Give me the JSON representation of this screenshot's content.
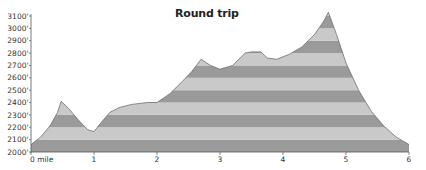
{
  "chart_data": {
    "type": "area",
    "title": "Round trip",
    "xlabel": "mile",
    "ylabel": "elevation (ft)",
    "x_ticks": [
      {
        "value": 0,
        "label": "0 mile"
      },
      {
        "value": 1,
        "label": "1"
      },
      {
        "value": 2,
        "label": "2"
      },
      {
        "value": 3,
        "label": "3"
      },
      {
        "value": 4,
        "label": "4"
      },
      {
        "value": 5,
        "label": "5"
      },
      {
        "value": 6,
        "label": "6"
      }
    ],
    "y_ticks": [
      {
        "value": 2000,
        "label": "2000'"
      },
      {
        "value": 2100,
        "label": "2100'"
      },
      {
        "value": 2200,
        "label": "2200'"
      },
      {
        "value": 2300,
        "label": "2300'"
      },
      {
        "value": 2400,
        "label": "2400'"
      },
      {
        "value": 2500,
        "label": "2500'"
      },
      {
        "value": 2600,
        "label": "2600'"
      },
      {
        "value": 2700,
        "label": "2700'"
      },
      {
        "value": 2800,
        "label": "2800'"
      },
      {
        "value": 2900,
        "label": "2900'"
      },
      {
        "value": 3000,
        "label": "3000'"
      },
      {
        "value": 3100,
        "label": "3100'"
      }
    ],
    "xlim": [
      0,
      6
    ],
    "ylim": [
      2000,
      3100
    ],
    "grid": false,
    "legend": null,
    "fill_style": "alternating horizontal bands every 100 ft",
    "band_colors": [
      "#9a9a9a",
      "#c9c9c9"
    ],
    "outline_color": "#6e6e6e",
    "x": [
      0,
      0.15,
      0.3,
      0.42,
      0.48,
      0.6,
      0.75,
      0.9,
      1.0,
      1.1,
      1.25,
      1.4,
      1.6,
      1.85,
      2.0,
      2.2,
      2.4,
      2.55,
      2.7,
      2.85,
      3.0,
      3.2,
      3.4,
      3.5,
      3.65,
      3.75,
      3.9,
      4.1,
      4.3,
      4.5,
      4.65,
      4.72,
      4.85,
      5.0,
      5.2,
      5.4,
      5.6,
      5.8,
      5.9,
      6.0
    ],
    "values": [
      2060,
      2120,
      2210,
      2320,
      2410,
      2350,
      2260,
      2180,
      2165,
      2230,
      2320,
      2360,
      2385,
      2400,
      2400,
      2470,
      2570,
      2650,
      2750,
      2700,
      2670,
      2700,
      2800,
      2810,
      2810,
      2760,
      2750,
      2790,
      2850,
      2950,
      3060,
      3130,
      2950,
      2720,
      2500,
      2330,
      2210,
      2120,
      2090,
      2060
    ]
  }
}
